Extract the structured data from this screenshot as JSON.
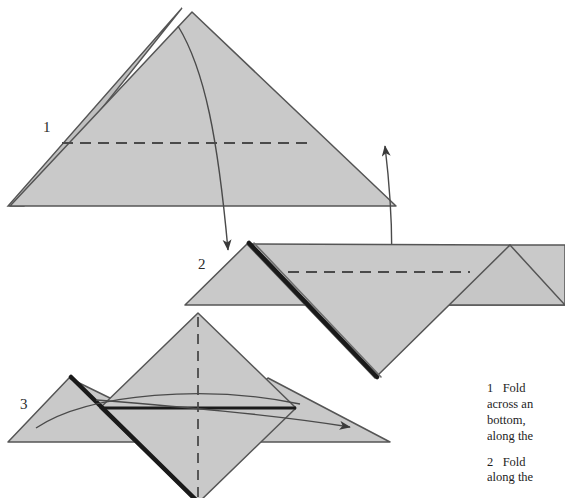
{
  "page": {
    "background_color": "#ffffff",
    "paper_fill_color": "#c9c9c9",
    "outline_color": "#555555",
    "bold_fold_color": "#1a1a1a",
    "width": 565,
    "height": 498
  },
  "diagrams": [
    {
      "number": "1",
      "label": "1",
      "description": "Large triangle with doubled left edge, horizontal dashed fold line, curved arrow folding down to the right"
    },
    {
      "number": "2",
      "label": "2",
      "description": "Chevron shape with bold dark diagonal edge, dashed horizontal fold line and deep V notch, curved arrow lifting upward"
    },
    {
      "number": "3",
      "label": "3",
      "description": "Central diamond with vertical dashed centre line flanked by side triangles, bold horizontal fold line, curved arrow passing to the right"
    }
  ],
  "captions": [
    {
      "number": "1",
      "text": "1   Fold\nacross an\nbottom,\nalong the"
    },
    {
      "number": "2",
      "text": "2   Fold\nalong the"
    },
    {
      "number": "3",
      "text": "3   Fold"
    }
  ]
}
